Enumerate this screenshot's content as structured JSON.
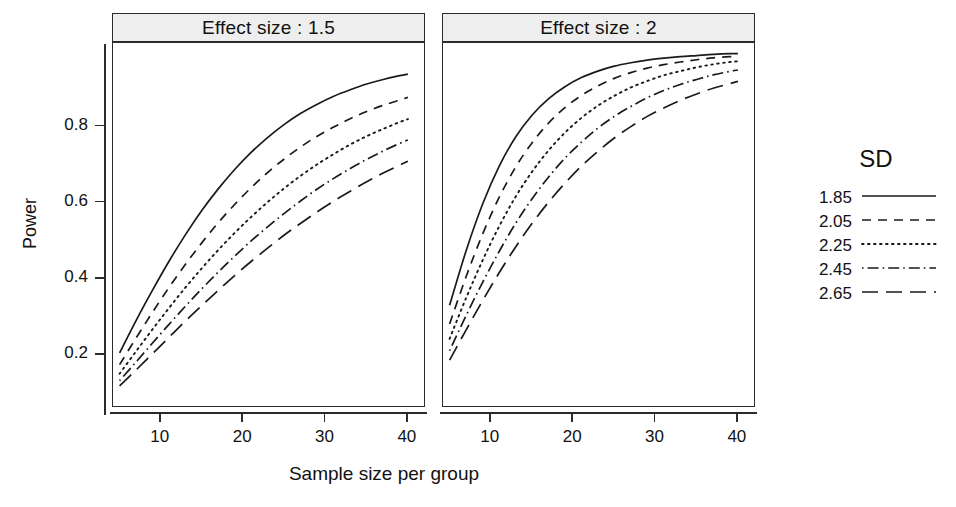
{
  "figure": {
    "xlabel": "Sample size per group",
    "ylabel": "Power",
    "background": "#ffffff",
    "line_color": "#1a1a1a",
    "strip_fill": "#eeeeee",
    "strip_border": "#2b2b2b"
  },
  "legend": {
    "title": "SD",
    "position": "right",
    "entries": [
      {
        "label": "1.85",
        "style": "solid",
        "dash": "none"
      },
      {
        "label": "2.05",
        "style": "dashed",
        "dash": "9,7"
      },
      {
        "label": "2.25",
        "style": "dotted",
        "dash": "1.6,4.4"
      },
      {
        "label": "2.45",
        "style": "dotdash",
        "dash": "1.6,4,11,4"
      },
      {
        "label": "2.65",
        "style": "longdash",
        "dash": "16,8"
      }
    ]
  },
  "axes": {
    "x_ticks": [
      "10",
      "20",
      "30",
      "40"
    ],
    "x_tick_values": [
      10,
      20,
      30,
      40
    ],
    "y_ticks": [
      "0.2",
      "0.4",
      "0.6",
      "0.8"
    ],
    "y_tick_values": [
      0.2,
      0.4,
      0.6,
      0.8
    ],
    "xlim": [
      4.2,
      42.2
    ],
    "ylim": [
      0.06,
      1.02
    ],
    "grid": false
  },
  "chart_data": {
    "type": "line",
    "title": "",
    "xlabel": "Sample size per group",
    "ylabel": "Power",
    "xlim": [
      4.2,
      42.2
    ],
    "ylim": [
      0.06,
      1.02
    ],
    "grid": false,
    "legend_title": "SD",
    "legend_position": "right",
    "facet_variable": "Effect size",
    "x": [
      5,
      7,
      9,
      11,
      13,
      15,
      17,
      19,
      21,
      23,
      25,
      27,
      29,
      31,
      33,
      35,
      37,
      39,
      40
    ],
    "panels": [
      {
        "label": "Effect size : 1.5",
        "effect_size": 1.5,
        "series": [
          {
            "name": "1.85",
            "style": "solid",
            "values": [
              0.205,
              0.29,
              0.37,
              0.446,
              0.516,
              0.58,
              0.637,
              0.688,
              0.733,
              0.772,
              0.806,
              0.835,
              0.859,
              0.88,
              0.897,
              0.912,
              0.924,
              0.934,
              0.938
            ]
          },
          {
            "name": "2.05",
            "style": "dashed",
            "values": [
              0.174,
              0.244,
              0.312,
              0.377,
              0.438,
              0.495,
              0.548,
              0.596,
              0.64,
              0.68,
              0.715,
              0.747,
              0.775,
              0.799,
              0.821,
              0.84,
              0.856,
              0.87,
              0.877
            ]
          },
          {
            "name": "2.25",
            "style": "dotted",
            "values": [
              0.15,
              0.209,
              0.267,
              0.323,
              0.377,
              0.428,
              0.476,
              0.521,
              0.563,
              0.602,
              0.638,
              0.671,
              0.701,
              0.728,
              0.753,
              0.775,
              0.794,
              0.812,
              0.82
            ]
          },
          {
            "name": "2.45",
            "style": "dotdash",
            "values": [
              0.132,
              0.181,
              0.231,
              0.28,
              0.328,
              0.374,
              0.418,
              0.46,
              0.5,
              0.537,
              0.572,
              0.605,
              0.636,
              0.664,
              0.69,
              0.714,
              0.736,
              0.756,
              0.765
            ]
          },
          {
            "name": "2.65",
            "style": "longdash",
            "values": [
              0.118,
              0.16,
              0.203,
              0.246,
              0.289,
              0.33,
              0.37,
              0.409,
              0.446,
              0.481,
              0.515,
              0.546,
              0.576,
              0.604,
              0.63,
              0.655,
              0.678,
              0.699,
              0.709
            ]
          }
        ]
      },
      {
        "label": "Effect size : 2",
        "effect_size": 2,
        "series": [
          {
            "name": "1.85",
            "style": "solid",
            "values": [
              0.33,
              0.473,
              0.596,
              0.695,
              0.772,
              0.83,
              0.873,
              0.905,
              0.929,
              0.946,
              0.959,
              0.968,
              0.975,
              0.98,
              0.984,
              0.987,
              0.99,
              0.992,
              0.992
            ]
          },
          {
            "name": "2.05",
            "style": "dashed",
            "values": [
              0.281,
              0.405,
              0.517,
              0.613,
              0.693,
              0.757,
              0.809,
              0.85,
              0.882,
              0.907,
              0.927,
              0.942,
              0.954,
              0.963,
              0.97,
              0.976,
              0.981,
              0.984,
              0.986
            ]
          },
          {
            "name": "2.25",
            "style": "dotted",
            "values": [
              0.242,
              0.349,
              0.448,
              0.537,
              0.615,
              0.681,
              0.737,
              0.784,
              0.823,
              0.855,
              0.881,
              0.903,
              0.92,
              0.935,
              0.946,
              0.956,
              0.964,
              0.97,
              0.972
            ]
          },
          {
            "name": "2.45",
            "style": "dotdash",
            "values": [
              0.211,
              0.303,
              0.39,
              0.471,
              0.545,
              0.61,
              0.667,
              0.717,
              0.759,
              0.796,
              0.827,
              0.853,
              0.876,
              0.895,
              0.911,
              0.924,
              0.936,
              0.945,
              0.949
            ]
          },
          {
            "name": "2.65",
            "style": "longdash",
            "values": [
              0.186,
              0.265,
              0.342,
              0.415,
              0.483,
              0.545,
              0.601,
              0.651,
              0.696,
              0.735,
              0.77,
              0.8,
              0.827,
              0.849,
              0.869,
              0.886,
              0.901,
              0.913,
              0.919
            ]
          }
        ]
      }
    ]
  }
}
